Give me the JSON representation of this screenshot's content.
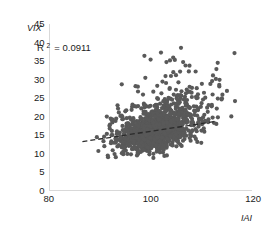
{
  "chart_data": {
    "type": "scatter",
    "title": "",
    "xlabel": "IAI",
    "ylabel": "VIX",
    "xlim": [
      80,
      120
    ],
    "ylim": [
      0,
      45
    ],
    "xticks": [
      80,
      100,
      120
    ],
    "yticks": [
      0,
      5,
      10,
      15,
      20,
      25,
      30,
      35,
      40,
      45
    ],
    "grid": false,
    "legend": null,
    "annotations": [
      {
        "text": "R² = 0.0911",
        "r2_value": 0.0911,
        "x_data": 84.5,
        "y_data": 40
      }
    ],
    "marker": {
      "color": "#595959",
      "size": 2.1,
      "shape": "circle"
    },
    "trend_line": {
      "style": "dashed",
      "color": "#2b2b2b",
      "x_start": 86.5,
      "y_start": 13.2,
      "x_end": 112.5,
      "y_end": 18.6
    },
    "point_clusters": [
      {
        "name": "main-dense-core",
        "n": 900,
        "x_center": 100.8,
        "y_center": 15.6,
        "x_sd": 2.6,
        "y_sd": 2.2
      },
      {
        "name": "mid-spread",
        "n": 420,
        "x_center": 101.5,
        "y_center": 17.4,
        "x_sd": 4.4,
        "y_sd": 3.6
      },
      {
        "name": "upper-right-tail",
        "n": 130,
        "x_center": 106.5,
        "y_center": 21.5,
        "x_sd": 4.5,
        "y_sd": 3.8
      },
      {
        "name": "left-low-tail",
        "n": 70,
        "x_center": 95.0,
        "y_center": 14.8,
        "x_sd": 2.8,
        "y_sd": 2.4
      },
      {
        "name": "high-outliers",
        "n": 38,
        "x_center": 105.0,
        "y_center": 28.0,
        "x_sd": 5.5,
        "y_sd": 4.5
      },
      {
        "name": "far-outliers",
        "n": 10,
        "x_center": 107.0,
        "y_center": 37.0,
        "x_sd": 5.0,
        "y_sd": 3.0
      }
    ]
  },
  "axes": {
    "y_axis_title": "VIX",
    "x_axis_title": "IAI",
    "y_tick_labels": [
      "45",
      "40",
      "35",
      "30",
      "25",
      "20",
      "15",
      "10",
      "5",
      "0"
    ],
    "x_tick_labels": [
      "80",
      "100",
      "120"
    ]
  },
  "annotation_text": "R = 0.0911",
  "annotation_prefix": "R",
  "annotation_superscript": "2",
  "annotation_suffix": "= 0.0911"
}
